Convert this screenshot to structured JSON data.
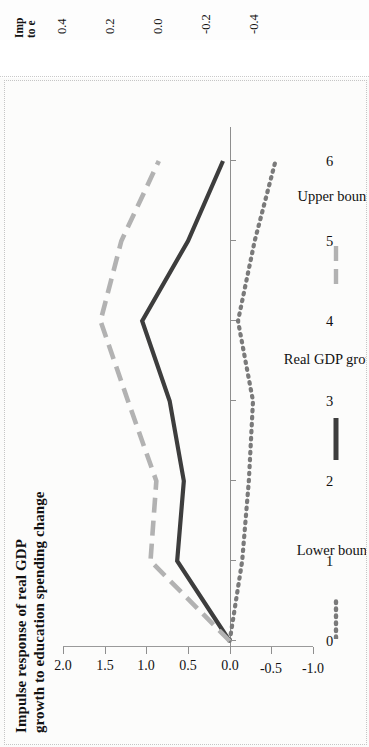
{
  "top_figure": {
    "title_line1": "Imp",
    "title_line2": "to e",
    "y_ticks": [
      "0.4",
      "0.2",
      "0.0",
      "-0.2",
      "-0.4"
    ]
  },
  "main_figure": {
    "title_line1": "Impulse response of real GDP",
    "title_line2": "growth to education spending change"
  },
  "chart_data": {
    "type": "line",
    "title": "Impulse response of real GDP growth to education spending change",
    "xlabel": "",
    "ylabel": "",
    "x": [
      0,
      1,
      2,
      3,
      4,
      5,
      6
    ],
    "xtick_labels": [
      "0",
      "1",
      "2",
      "3",
      "4",
      "5",
      "6"
    ],
    "ytick_labels": [
      "2.0",
      "1.5",
      "1.0",
      "0.5",
      "0.0",
      "-0.5",
      "-1.0"
    ],
    "yticks": [
      2.0,
      1.5,
      1.0,
      0.5,
      0.0,
      -0.5,
      -1.0
    ],
    "ylim": [
      -1.0,
      2.0
    ],
    "xlim": [
      0,
      6
    ],
    "grid": false,
    "legend_position": "bottom",
    "rotation": "90deg clockwise (page is sideways)",
    "series": [
      {
        "name": "Lower bound",
        "style": "dotted",
        "color": "#7a7a7a",
        "values": [
          0.0,
          -0.15,
          -0.23,
          -0.28,
          -0.1,
          -0.3,
          -0.55
        ]
      },
      {
        "name": "Real GDP growth",
        "style": "solid",
        "color": "#3d3d3d",
        "values": [
          0.0,
          0.63,
          0.55,
          0.72,
          1.05,
          0.5,
          0.08
        ]
      },
      {
        "name": "Upper bound",
        "style": "dashed",
        "color": "#b2b2b2",
        "values": [
          0.0,
          0.95,
          0.88,
          1.22,
          1.55,
          1.3,
          0.85
        ]
      }
    ]
  }
}
